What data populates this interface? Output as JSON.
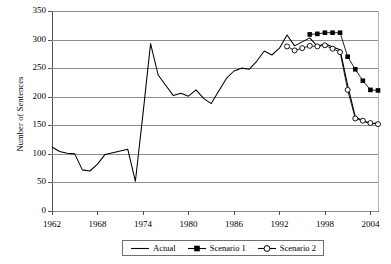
{
  "chart_data": {
    "type": "line",
    "title": "",
    "xlabel": "",
    "ylabel": "Number of Sentences",
    "xlim": [
      1962,
      2005
    ],
    "ylim": [
      0,
      350
    ],
    "ytick_step": 50,
    "yticks": [
      0,
      50,
      100,
      150,
      200,
      250,
      300,
      350
    ],
    "xticks": [
      1962,
      1968,
      1974,
      1980,
      1986,
      1992,
      1998,
      2004
    ],
    "grid": true,
    "legend_position": "bottom-center",
    "series": [
      {
        "name": "Actual",
        "marker": "none",
        "color": "#000000",
        "x": [
          1962,
          1963,
          1964,
          1965,
          1966,
          1967,
          1968,
          1969,
          1970,
          1971,
          1972,
          1973,
          1974,
          1975,
          1976,
          1977,
          1978,
          1979,
          1980,
          1981,
          1982,
          1983,
          1984,
          1985,
          1986,
          1987,
          1988,
          1989,
          1990,
          1991,
          1992,
          1993,
          1994,
          1995,
          1996,
          1997,
          1998,
          1999,
          2000,
          2001,
          2002,
          2003,
          2004,
          2005
        ],
        "values": [
          112,
          104,
          101,
          100,
          72,
          70,
          82,
          99,
          102,
          105,
          108,
          52,
          170,
          293,
          238,
          220,
          202,
          206,
          201,
          212,
          197,
          188,
          210,
          232,
          245,
          250,
          248,
          262,
          280,
          273,
          285,
          308,
          289,
          296,
          303,
          288,
          293,
          287,
          282,
          220,
          165,
          158,
          152,
          155
        ]
      },
      {
        "name": "Scenario 1",
        "marker": "filled-square",
        "color": "#000000",
        "x": [
          1996,
          1997,
          1998,
          1999,
          2000,
          2001,
          2002,
          2003,
          2004,
          2005
        ],
        "values": [
          309,
          310,
          312,
          312,
          312,
          270,
          248,
          228,
          212,
          211
        ]
      },
      {
        "name": "Scenario 2",
        "marker": "open-circle",
        "color": "#000000",
        "x": [
          1993,
          1994,
          1995,
          1996,
          1997,
          1998,
          1999,
          2000,
          2001,
          2002,
          2003,
          2004,
          2005
        ],
        "values": [
          288,
          281,
          285,
          289,
          288,
          290,
          284,
          278,
          212,
          162,
          158,
          154,
          152
        ]
      }
    ]
  },
  "legend": {
    "items": [
      {
        "label": "Actual",
        "marker": "line"
      },
      {
        "label": "Scenario 1",
        "marker": "filled-square"
      },
      {
        "label": "Scenario 2",
        "marker": "open-circle"
      }
    ]
  }
}
